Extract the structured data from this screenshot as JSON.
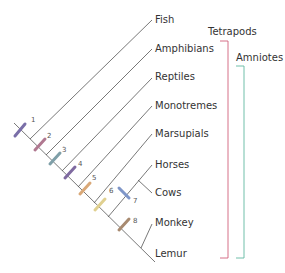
{
  "diagram": {
    "type": "cladogram",
    "taxa": [
      {
        "name": "Fish",
        "x": 160,
        "y": 15
      },
      {
        "name": "Amphibians",
        "x": 160,
        "y": 44
      },
      {
        "name": "Reptiles",
        "x": 160,
        "y": 72
      },
      {
        "name": "Monotremes",
        "x": 160,
        "y": 101
      },
      {
        "name": "Marsupials",
        "x": 160,
        "y": 129
      },
      {
        "name": "Horses",
        "x": 160,
        "y": 158
      },
      {
        "name": "Cows",
        "x": 160,
        "y": 188
      },
      {
        "name": "Monkey",
        "x": 160,
        "y": 216
      },
      {
        "name": "Lemur",
        "x": 160,
        "y": 248
      }
    ],
    "markers": [
      {
        "label": "1",
        "x": 20,
        "y": 130,
        "color": "#7a6fa8"
      },
      {
        "label": "2",
        "x": 40,
        "y": 144,
        "color": "#b07890"
      },
      {
        "label": "3",
        "x": 55,
        "y": 158,
        "color": "#7f9fa8"
      },
      {
        "label": "4",
        "x": 70,
        "y": 172,
        "color": "#7f6aa0"
      },
      {
        "label": "5",
        "x": 85,
        "y": 188,
        "color": "#d9a878"
      },
      {
        "label": "6",
        "x": 100,
        "y": 204,
        "color": "#e0d090"
      },
      {
        "label": "7",
        "x": 125,
        "y": 193,
        "color": "#7f96c8"
      },
      {
        "label": "8",
        "x": 125,
        "y": 224,
        "color": "#a88a70"
      }
    ],
    "groups": [
      {
        "name": "Tetrapods",
        "color": "#d0607a"
      },
      {
        "name": "Amniotes",
        "color": "#60b8a0"
      }
    ]
  }
}
